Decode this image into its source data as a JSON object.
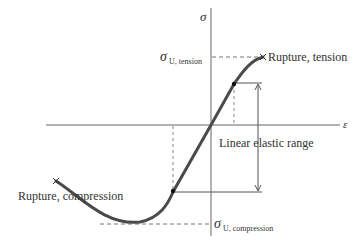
{
  "diagram": {
    "type": "stress-strain curve",
    "axes": {
      "x_label": "ε",
      "y_label": "σ"
    },
    "labels": {
      "rupture_tension": "Rupture, tension",
      "rupture_compression": "Rupture, compression",
      "linear_elastic_range": "Linear elastic range",
      "sigma_symbol": "σ",
      "sigma_u_tension_sub": "U, tension",
      "sigma_u_compression_sub": "U, compression"
    },
    "colors": {
      "curve": "#4a4a4a",
      "axes": "#555555",
      "dashed": "#777777"
    }
  }
}
